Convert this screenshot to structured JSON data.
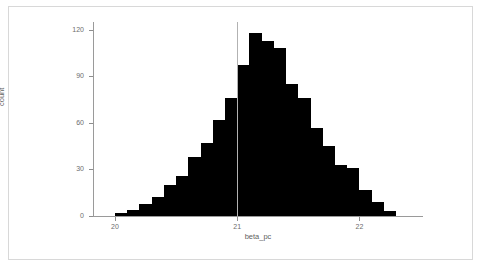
{
  "chart_data": {
    "type": "bar",
    "title": "",
    "subtitle": "",
    "xlabel": "beta_pc",
    "ylabel": "count",
    "xlim": [
      19.82,
      22.52
    ],
    "ylim": [
      0,
      125
    ],
    "grid": false,
    "legend": null,
    "x_ticks": [
      20,
      21,
      22
    ],
    "x_tick_labels": [
      "20",
      "21",
      "22"
    ],
    "y_ticks": [
      0,
      30,
      60,
      90,
      120
    ],
    "y_tick_labels": [
      "0",
      "30",
      "60",
      "90",
      "120"
    ],
    "bin_width": 0.1,
    "annotations": [
      {
        "type": "vline",
        "x": 21.0,
        "color": "#b2b2b2",
        "label": ""
      }
    ],
    "categories": [
      "20.00",
      "20.10",
      "20.20",
      "20.30",
      "20.40",
      "20.50",
      "20.60",
      "20.70",
      "20.80",
      "20.90",
      "21.00",
      "21.10",
      "21.20",
      "21.30",
      "21.40",
      "21.50",
      "21.60",
      "21.70",
      "21.80",
      "21.90",
      "22.00",
      "22.10",
      "22.20"
    ],
    "bin_left_edges": [
      20.0,
      20.1,
      20.2,
      20.3,
      20.4,
      20.5,
      20.6,
      20.7,
      20.8,
      20.9,
      21.0,
      21.1,
      21.2,
      21.3,
      21.4,
      21.5,
      21.6,
      21.7,
      21.8,
      21.9,
      22.0,
      22.1,
      22.2
    ],
    "values": [
      2,
      4,
      8,
      12,
      20,
      26,
      38,
      47,
      62,
      76,
      97,
      118,
      113,
      108,
      85,
      76,
      57,
      45,
      33,
      31,
      17,
      9,
      3
    ]
  },
  "axes": {
    "y_title": "count",
    "x_title": "beta_pc"
  }
}
